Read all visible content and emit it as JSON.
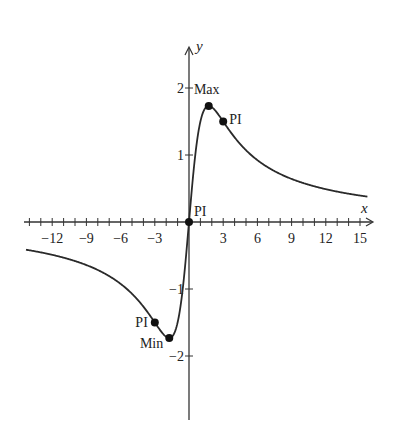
{
  "chart_data": {
    "type": "line",
    "title": "",
    "xlabel": "x",
    "ylabel": "y",
    "xlim": [
      -14.5,
      15.5
    ],
    "ylim": [
      -3,
      2.8
    ],
    "x_ticks": [
      "-12",
      "-9",
      "-6",
      "-3",
      "3",
      "6",
      "9",
      "12",
      "15"
    ],
    "y_ticks": [
      "2",
      "1",
      "-1",
      "-2"
    ],
    "function_approx": "y = 6x / (x^2 + 3)",
    "series": [
      {
        "name": "curve",
        "x": [
          -14,
          -12,
          -9,
          -6,
          -3,
          -1.73,
          -1,
          0,
          1,
          1.73,
          3,
          6,
          9,
          12,
          15
        ],
        "values": [
          -0.42,
          -0.49,
          -0.64,
          -0.92,
          -1.5,
          -1.73,
          -1.5,
          0,
          1.5,
          1.73,
          1.5,
          0.92,
          0.64,
          0.49,
          0.39
        ]
      }
    ],
    "annotations": [
      {
        "label": "Max",
        "x": 1.73,
        "y": 1.73
      },
      {
        "label": "PI",
        "x": 3,
        "y": 1.5
      },
      {
        "label": "PI",
        "x": 0,
        "y": 0
      },
      {
        "label": "PI",
        "x": -3,
        "y": -1.5
      },
      {
        "label": "Min",
        "x": -1.73,
        "y": -1.73
      }
    ],
    "grid": false,
    "legend": "none"
  },
  "labels": {
    "x_axis": "x",
    "y_axis": "y",
    "max": "Max",
    "min": "Min",
    "pi": "PI"
  }
}
